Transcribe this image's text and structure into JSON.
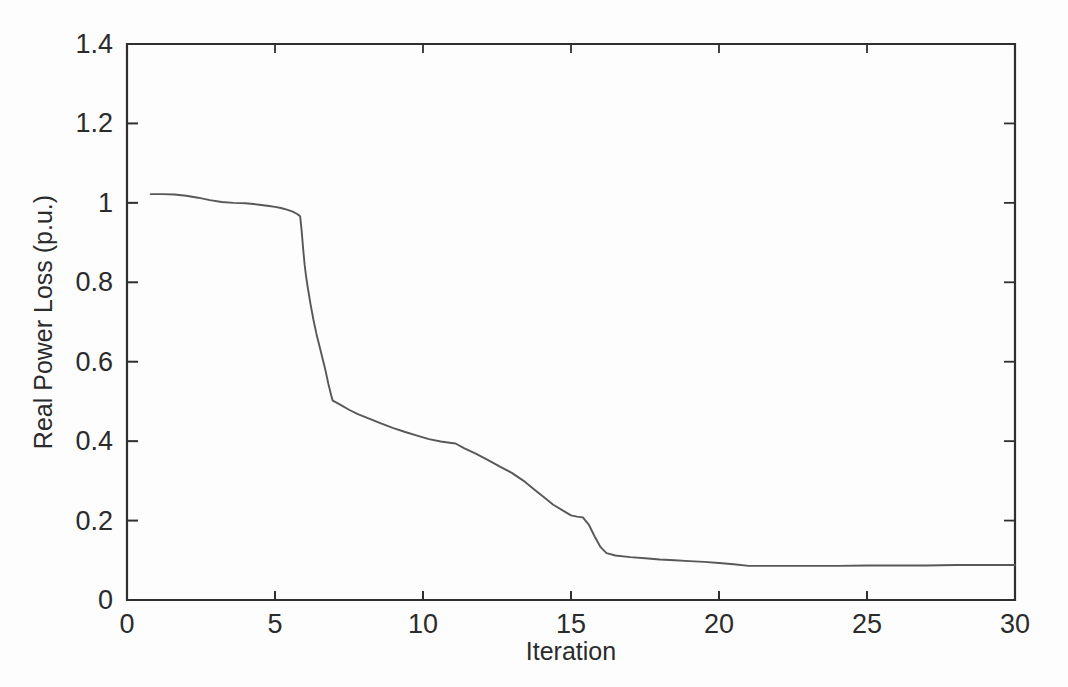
{
  "chart_data": {
    "type": "line",
    "title": "",
    "xlabel": "Iteration",
    "ylabel": "Real Power Loss (p.u.)",
    "xlim": [
      0,
      30
    ],
    "ylim": [
      0,
      1.4
    ],
    "xticks": [
      0,
      5,
      10,
      15,
      20,
      25,
      30
    ],
    "xticklabels": [
      "0",
      "5",
      "10",
      "15",
      "20",
      "25",
      "30"
    ],
    "yticks": [
      0,
      0.2,
      0.4,
      0.6,
      0.8,
      1.0,
      1.2,
      1.4
    ],
    "yticklabels": [
      "0",
      "0.2",
      "0.4",
      "0.6",
      "0.8",
      "1",
      "1.2",
      "1.4"
    ],
    "grid": false,
    "legend": null,
    "line_color": "#58585a",
    "axis_color": "#2f2f2f",
    "background_color": "#fdfdfd",
    "series": [
      {
        "name": "Real Power Loss",
        "x": [
          0.8,
          1.2,
          1.6,
          2.0,
          2.4,
          2.8,
          3.2,
          3.6,
          4.0,
          4.4,
          4.8,
          5.0,
          5.2,
          5.4,
          5.6,
          5.75,
          5.85,
          5.9,
          5.95,
          6.0,
          6.05,
          6.1,
          6.2,
          6.3,
          6.4,
          6.5,
          6.6,
          6.7,
          6.8,
          6.9,
          6.95,
          7.0,
          7.2,
          7.5,
          7.8,
          8.2,
          8.6,
          9.0,
          9.4,
          9.8,
          10.2,
          10.6,
          10.9,
          11.1,
          11.4,
          11.8,
          12.2,
          12.6,
          13.0,
          13.4,
          13.8,
          14.1,
          14.4,
          14.8,
          15.0,
          15.2,
          15.4,
          15.6,
          15.8,
          16.0,
          16.2,
          16.5,
          17.0,
          17.5,
          18.0,
          18.5,
          19.0,
          19.5,
          20.0,
          20.5,
          21.0,
          22.0,
          23.0,
          24.0,
          25.0,
          26.0,
          27.0,
          28.0,
          29.0,
          30.0
        ],
        "y": [
          1.022,
          1.022,
          1.021,
          1.018,
          1.013,
          1.007,
          1.002,
          1.0,
          0.999,
          0.996,
          0.992,
          0.99,
          0.987,
          0.983,
          0.978,
          0.972,
          0.966,
          0.93,
          0.885,
          0.845,
          0.815,
          0.79,
          0.745,
          0.705,
          0.67,
          0.64,
          0.61,
          0.58,
          0.545,
          0.515,
          0.502,
          0.5,
          0.492,
          0.479,
          0.468,
          0.456,
          0.444,
          0.433,
          0.423,
          0.414,
          0.405,
          0.399,
          0.396,
          0.394,
          0.382,
          0.368,
          0.352,
          0.336,
          0.32,
          0.3,
          0.276,
          0.258,
          0.24,
          0.222,
          0.213,
          0.21,
          0.208,
          0.19,
          0.16,
          0.133,
          0.118,
          0.112,
          0.108,
          0.105,
          0.102,
          0.1,
          0.098,
          0.096,
          0.093,
          0.09,
          0.086,
          0.086,
          0.086,
          0.086,
          0.087,
          0.087,
          0.087,
          0.088,
          0.088,
          0.088
        ]
      }
    ]
  },
  "axis_labels": {
    "x": "Iteration",
    "y": "Real Power Loss (p.u.)"
  }
}
